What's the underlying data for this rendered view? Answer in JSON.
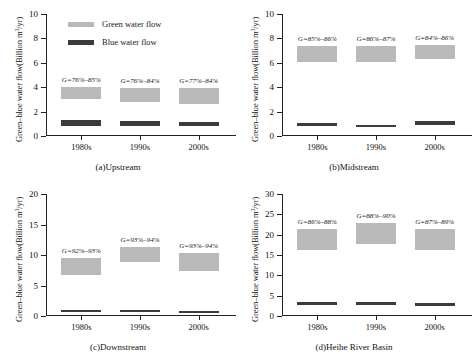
{
  "legend": {
    "items": [
      {
        "label": "Green water flow",
        "color": "#b9b9b9",
        "key": "green"
      },
      {
        "label": "Blue water flow",
        "color": "#3b3b3b",
        "key": "blue"
      }
    ]
  },
  "axis": {
    "ylabel_text": "Green–blue water flow(Billion m",
    "ylabel_sup": "3",
    "ylabel_tail": "/yr)"
  },
  "panels": [
    {
      "id": "a",
      "caption": "(a)Upstream",
      "ylabel": "Green–blue water flow(Billion m³/yr)",
      "ymin": 0,
      "ymax": 10,
      "ystep": 2,
      "yticks": [
        "0",
        "2",
        "4",
        "6",
        "8",
        "10"
      ],
      "categories": [
        "1980s",
        "1990s",
        "2000s"
      ],
      "annotations": [
        "G=76%–85%",
        "G=76%–84%",
        "G=77%–84%"
      ],
      "green_low": [
        3.0,
        2.8,
        2.6
      ],
      "green_high": [
        4.0,
        3.9,
        3.9
      ],
      "blue_low": [
        0.85,
        0.85,
        0.8
      ],
      "blue_high": [
        1.3,
        1.25,
        1.15
      ]
    },
    {
      "id": "b",
      "caption": "(b)Midstream",
      "ylabel": "Green–blue water flow(Billion m³/yr)",
      "ymin": 0,
      "ymax": 10,
      "ystep": 2,
      "yticks": [
        "0",
        "2",
        "4",
        "6",
        "8",
        "10"
      ],
      "categories": [
        "1980s",
        "1990s",
        "2000s"
      ],
      "annotations": [
        "G=85%–86%",
        "G=86%–87%",
        "G=84%–86%"
      ],
      "green_low": [
        6.1,
        6.1,
        6.3
      ],
      "green_high": [
        7.4,
        7.4,
        7.5
      ],
      "blue_low": [
        0.85,
        0.7,
        0.9
      ],
      "blue_high": [
        1.1,
        0.92,
        1.25
      ]
    },
    {
      "id": "c",
      "caption": "(c)Downstream",
      "ylabel": "Green–blue water flow(Billion m³/yr)",
      "ymin": 0,
      "ymax": 20,
      "ystep": 5,
      "yticks": [
        "0",
        "5",
        "10",
        "15",
        "20"
      ],
      "categories": [
        "1980s",
        "1990s",
        "2000s"
      ],
      "annotations": [
        "G=92%–93%",
        "G=93%–94%",
        "G=93%–94%"
      ],
      "green_low": [
        6.8,
        8.8,
        7.4
      ],
      "green_high": [
        9.5,
        11.3,
        10.3
      ],
      "blue_low": [
        0.7,
        0.7,
        0.62
      ],
      "blue_high": [
        0.95,
        0.95,
        0.85
      ]
    },
    {
      "id": "d",
      "caption": "(d)Heihe River Basin",
      "ylabel": "Green–blue water flow(Billion m³/yr)",
      "ymin": 0,
      "ymax": 30,
      "ystep": 5,
      "yticks": [
        "0",
        "5",
        "10",
        "15",
        "20",
        "25",
        "30"
      ],
      "categories": [
        "1980s",
        "1990s",
        "2000s"
      ],
      "annotations": [
        "G=86%–88%",
        "G=88%–90%",
        "G=87%–89%"
      ],
      "green_low": [
        16.2,
        17.8,
        16.2
      ],
      "green_high": [
        21.3,
        22.8,
        21.5
      ],
      "blue_low": [
        2.6,
        2.6,
        2.5
      ],
      "blue_high": [
        3.4,
        3.4,
        3.3
      ]
    }
  ],
  "chart_data": {
    "type": "bar",
    "title": "",
    "xlabel": "",
    "ylabel": "Green–blue water flow(Billion m³/yr)",
    "grid": false,
    "legend_position": "inside-top-left-panel-a",
    "note": "Each decade shows two floating range boxes: light-grey = green water flow range, dark = blue water flow range. G = green water coefficient range annotated above each green box.",
    "panels": [
      {
        "panel": "(a)Upstream",
        "categories": [
          "1980s",
          "1990s",
          "2000s"
        ],
        "ylim": [
          0,
          10
        ],
        "yticks": [
          0,
          2,
          4,
          6,
          8,
          10
        ],
        "series": [
          {
            "name": "Green water flow",
            "low": [
              3.0,
              2.8,
              2.6
            ],
            "high": [
              4.0,
              3.9,
              3.9
            ]
          },
          {
            "name": "Blue water flow",
            "low": [
              0.85,
              0.85,
              0.8
            ],
            "high": [
              1.3,
              1.25,
              1.15
            ]
          }
        ],
        "annotations": [
          "G=76%–85%",
          "G=76%–84%",
          "G=77%–84%"
        ]
      },
      {
        "panel": "(b)Midstream",
        "categories": [
          "1980s",
          "1990s",
          "2000s"
        ],
        "ylim": [
          0,
          10
        ],
        "yticks": [
          0,
          2,
          4,
          6,
          8,
          10
        ],
        "series": [
          {
            "name": "Green water flow",
            "low": [
              6.1,
              6.1,
              6.3
            ],
            "high": [
              7.4,
              7.4,
              7.5
            ]
          },
          {
            "name": "Blue water flow",
            "low": [
              0.85,
              0.7,
              0.9
            ],
            "high": [
              1.1,
              0.92,
              1.25
            ]
          }
        ],
        "annotations": [
          "G=85%–86%",
          "G=86%–87%",
          "G=84%–86%"
        ]
      },
      {
        "panel": "(c)Downstream",
        "categories": [
          "1980s",
          "1990s",
          "2000s"
        ],
        "ylim": [
          0,
          20
        ],
        "yticks": [
          0,
          5,
          10,
          15,
          20
        ],
        "series": [
          {
            "name": "Green water flow",
            "low": [
              6.8,
              8.8,
              7.4
            ],
            "high": [
              9.5,
              11.3,
              10.3
            ]
          },
          {
            "name": "Blue water flow",
            "low": [
              0.7,
              0.7,
              0.62
            ],
            "high": [
              0.95,
              0.95,
              0.85
            ]
          }
        ],
        "annotations": [
          "G=92%–93%",
          "G=93%–94%",
          "G=93%–94%"
        ]
      },
      {
        "panel": "(d)Heihe River Basin",
        "categories": [
          "1980s",
          "1990s",
          "2000s"
        ],
        "ylim": [
          0,
          30
        ],
        "yticks": [
          0,
          5,
          10,
          15,
          20,
          25,
          30
        ],
        "series": [
          {
            "name": "Green water flow",
            "low": [
              16.2,
              17.8,
              16.2
            ],
            "high": [
              21.3,
              22.8,
              21.5
            ]
          },
          {
            "name": "Blue water flow",
            "low": [
              2.6,
              2.6,
              2.5
            ],
            "high": [
              3.4,
              3.4,
              3.3
            ]
          }
        ],
        "annotations": [
          "G=86%–88%",
          "G=88%–90%",
          "G=87%–89%"
        ]
      }
    ]
  }
}
